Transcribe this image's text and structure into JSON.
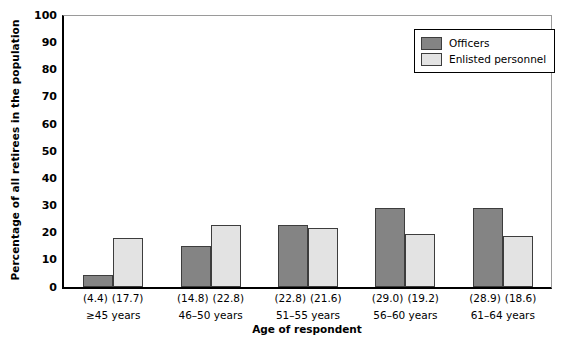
{
  "chart_data": {
    "type": "bar",
    "title": "",
    "xlabel": "Age of respondent",
    "ylabel": "Percentage of all retirees in the population",
    "ylim": [
      0,
      100
    ],
    "ytick_step": 10,
    "yticks": [
      0,
      10,
      20,
      30,
      40,
      50,
      60,
      70,
      80,
      90,
      100
    ],
    "grid": false,
    "legend_position": "top-right",
    "categories": [
      "≥45 years",
      "46–50 years",
      "51–55 years",
      "56–60 years",
      "61–64 years"
    ],
    "series": [
      {
        "name": "Officers",
        "color": "#848484",
        "values": [
          4.4,
          14.8,
          22.8,
          29.0,
          28.9
        ],
        "labels": [
          "(4.4)",
          "(14.8)",
          "(22.8)",
          "(29.0)",
          "(28.9)"
        ]
      },
      {
        "name": "Enlisted personnel",
        "color": "#e3e3e3",
        "values": [
          17.7,
          22.8,
          21.6,
          19.2,
          18.6
        ],
        "labels": [
          "(17.7)",
          "(22.8)",
          "(21.6)",
          "(19.2)",
          "(18.6)"
        ]
      }
    ]
  },
  "axes": {
    "y": {
      "title": "Percentage of all retirees in the population",
      "ticks": [
        "0",
        "10",
        "20",
        "30",
        "40",
        "50",
        "60",
        "70",
        "80",
        "90",
        "100"
      ]
    },
    "x": {
      "title": "Age of respondent",
      "groups": [
        {
          "category": "≥45 years",
          "officers_label": "(4.4)",
          "enlisted_label": "(17.7)"
        },
        {
          "category": "46–50 years",
          "officers_label": "(14.8)",
          "enlisted_label": "(22.8)"
        },
        {
          "category": "51–55 years",
          "officers_label": "(22.8)",
          "enlisted_label": "(21.6)"
        },
        {
          "category": "56–60 years",
          "officers_label": "(29.0)",
          "enlisted_label": "(19.2)"
        },
        {
          "category": "61–64 years",
          "officers_label": "(28.9)",
          "enlisted_label": "(18.6)"
        }
      ]
    }
  },
  "legend": {
    "entries": [
      {
        "label": "Officers",
        "color": "#848484"
      },
      {
        "label": "Enlisted personnel",
        "color": "#e3e3e3"
      }
    ]
  }
}
